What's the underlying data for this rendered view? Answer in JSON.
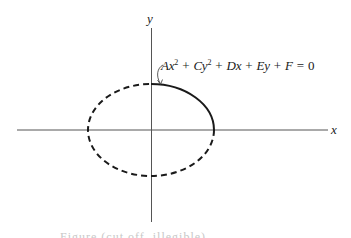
{
  "figure": {
    "axes": {
      "x_label": "x",
      "y_label": "y"
    },
    "equation": {
      "parts": {
        "A": "A",
        "x1": "x",
        "exp1": "2",
        "plus1": " + ",
        "C": "C",
        "y1": "y",
        "exp2": "2",
        "plus2": " + ",
        "Dx": "Dx",
        "plus3": " + ",
        "Ey": "Ey",
        "plus4": " + ",
        "F": "F",
        "eq": " = ",
        "zero": "0"
      },
      "full_text": "Ax² + Cy² + Dx + Ey + F = 0"
    },
    "ellipse": {
      "center_x": 151,
      "center_y": 130,
      "rx": 63,
      "ry": 46,
      "solid_arc": "first quadrant (top to right)",
      "dashed_arc": "remaining three quadrants"
    },
    "colors": {
      "stroke": "#1a1a1a",
      "axis": "#555555",
      "background": "#ffffff"
    },
    "caption": "Figure (cut off, illegible)"
  }
}
